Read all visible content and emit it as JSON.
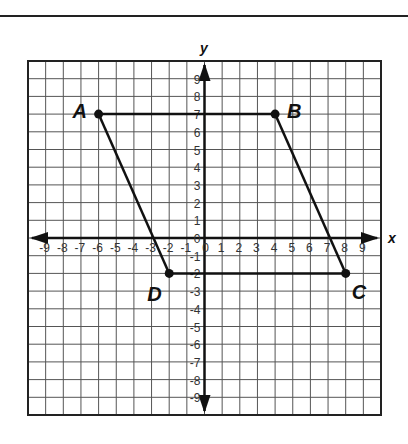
{
  "figure": {
    "x_axis_label": "x",
    "y_axis_label": "y",
    "x_range": [
      -9,
      9
    ],
    "y_range": [
      -9,
      9
    ],
    "x_ticks": [
      "-9",
      "-8",
      "-7",
      "-6",
      "-5",
      "-4",
      "-3",
      "-2",
      "-1",
      "0",
      "1",
      "2",
      "3",
      "4",
      "5",
      "6",
      "7",
      "8",
      "9"
    ],
    "y_ticks": [
      "9",
      "8",
      "7",
      "6",
      "5",
      "4",
      "3",
      "2",
      "1",
      "0",
      "-1",
      "-2",
      "-3",
      "-4",
      "-5",
      "-6",
      "-7",
      "-8",
      "-9"
    ],
    "points": [
      {
        "label": "A",
        "x": -6,
        "y": 7
      },
      {
        "label": "B",
        "x": 4,
        "y": 7
      },
      {
        "label": "C",
        "x": 8,
        "y": -2
      },
      {
        "label": "D",
        "x": -2,
        "y": -2
      }
    ],
    "segments": [
      [
        "A",
        "B"
      ],
      [
        "B",
        "C"
      ],
      [
        "C",
        "D"
      ],
      [
        "D",
        "A"
      ]
    ],
    "colors": {
      "grid": "#555555",
      "axis": "#111111",
      "shape": "#111111"
    }
  }
}
